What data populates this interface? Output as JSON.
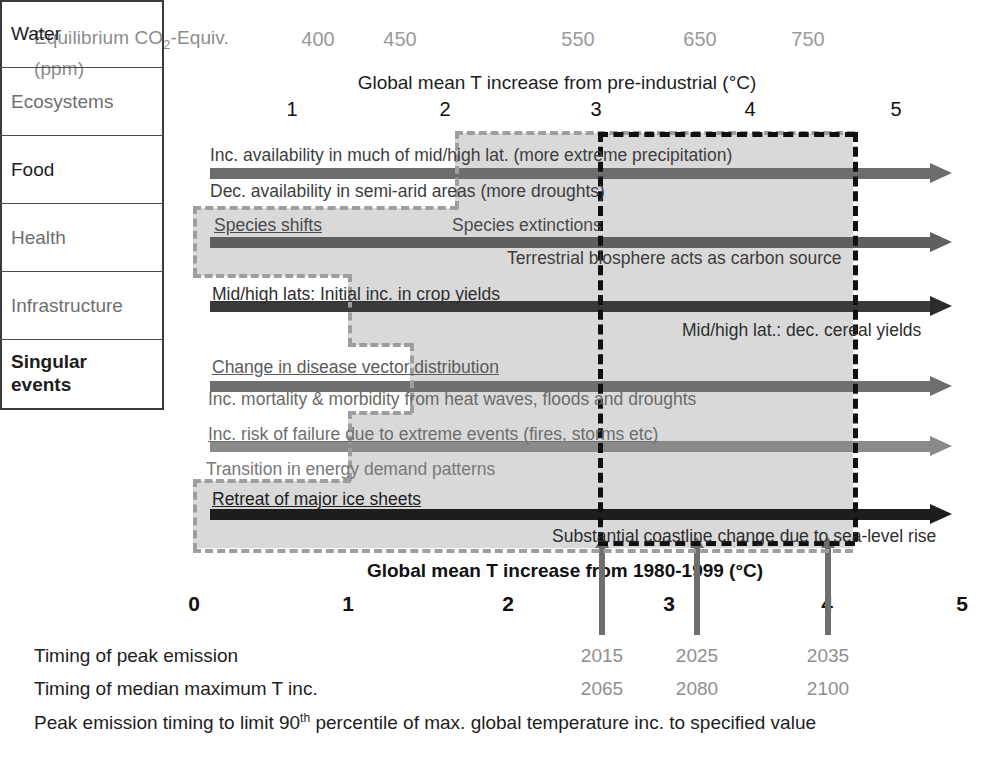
{
  "header": {
    "co2_label_line1": "Equilibrium CO",
    "co2_label_sub": "2",
    "co2_label_line1b": "-Equiv.",
    "co2_label_line2": "(ppm)",
    "co2_ticks": [
      {
        "label": "400",
        "x": 318
      },
      {
        "label": "450",
        "x": 400
      },
      {
        "label": "550",
        "x": 578
      },
      {
        "label": "650",
        "x": 700
      },
      {
        "label": "750",
        "x": 808
      }
    ],
    "top_axis_title": "Global mean T increase from pre-industrial (°C)",
    "top_ticks": [
      {
        "label": "1",
        "x": 292
      },
      {
        "label": "2",
        "x": 445
      },
      {
        "label": "3",
        "x": 596
      },
      {
        "label": "4",
        "x": 750
      },
      {
        "label": "5",
        "x": 896
      }
    ]
  },
  "categories": [
    {
      "name": "Water",
      "y": 140,
      "h": 68
    },
    {
      "name": "Ecosystems",
      "y": 208,
      "h": 68
    },
    {
      "name": "Food",
      "y": 276,
      "h": 68
    },
    {
      "name": "Health",
      "y": 344,
      "h": 68
    },
    {
      "name": "Infrastructure",
      "y": 412,
      "h": 68
    },
    {
      "name": "Singular\nevents",
      "y": 480,
      "h": 66
    }
  ],
  "impact_arrows": [
    {
      "name": "water-arrow",
      "x": 210,
      "y": 168,
      "tip": 952,
      "color": "#6d6d6d",
      "head_color": "#6d6d6d"
    },
    {
      "name": "ecosystems-arrow",
      "x": 210,
      "y": 237,
      "tip": 952,
      "color": "#5f5f5f",
      "head_color": "#5f5f5f"
    },
    {
      "name": "food-arrow",
      "x": 210,
      "y": 301,
      "tip": 952,
      "color": "#3a3a3a",
      "head_color": "#2b2b2b"
    },
    {
      "name": "health-arrow",
      "x": 210,
      "y": 381,
      "tip": 952,
      "color": "#6f6f6f",
      "head_color": "#6f6f6f"
    },
    {
      "name": "infrastructure-arrow",
      "x": 210,
      "y": 441,
      "tip": 952,
      "color": "#8a8a8a",
      "head_color": "#8a8a8a"
    },
    {
      "name": "singular-events-arrow",
      "x": 210,
      "y": 509,
      "tip": 952,
      "color": "#1d1d1d",
      "head_color": "#1d1d1d"
    }
  ],
  "impacts": [
    {
      "text": "Inc.  availability in much of mid/high lat. (more extreme precipitation)",
      "x": 210,
      "y": 145,
      "color": "#3d3d3d",
      "underline": false
    },
    {
      "text": "Dec. availability in semi-arid areas (more droughts)",
      "x": 210,
      "y": 181,
      "color": "#3d3d3d",
      "underline": false
    },
    {
      "text": "Species shifts",
      "x": 214,
      "y": 215,
      "color": "#4a4a4a",
      "underline": true
    },
    {
      "text": "Species extinctions",
      "x": 452,
      "y": 215,
      "color": "#4a4a4a",
      "underline": false
    },
    {
      "text": "Terrestrial biosphere acts as carbon source",
      "x": 507,
      "y": 248,
      "color": "#3d3d3d",
      "underline": false
    },
    {
      "text": "Mid/high lats: Initial inc. in crop yields",
      "x": 212,
      "y": 284,
      "color": "#2e2e2e",
      "underline": true
    },
    {
      "text": "Mid/high lat.: dec. cereal yields",
      "x": 682,
      "y": 320,
      "color": "#2e2e2e",
      "underline": false
    },
    {
      "text": "Change in disease vector distribution",
      "x": 212,
      "y": 357,
      "color": "#5a5a5a",
      "underline": true
    },
    {
      "text": "Inc. mortality & morbidity from heat waves, floods and droughts",
      "x": 208,
      "y": 389,
      "color": "#6a6a6a",
      "underline": false
    },
    {
      "text": "Inc. risk of failure due to extreme events (fires, storms etc)",
      "x": 208,
      "y": 424,
      "color": "#6d6d6d",
      "underline": true
    },
    {
      "text": "Transition in energy demand patterns",
      "x": 206,
      "y": 459,
      "color": "#787878",
      "underline": false
    },
    {
      "text": "Retreat of major ice sheets",
      "x": 212,
      "y": 489,
      "color": "#1d1d1d",
      "underline": true
    },
    {
      "text": "Substantial coastline change due to sea-level rise",
      "x": 552,
      "y": 526,
      "color": "#2e2e2e",
      "underline": false
    }
  ],
  "bottom_axis": {
    "title": "Global mean T increase from 1980-1999 (°C)",
    "ticks": [
      {
        "label": "0",
        "x": 194
      },
      {
        "label": "1",
        "x": 348
      },
      {
        "label": "2",
        "x": 508
      },
      {
        "label": "3",
        "x": 669
      },
      {
        "label": "4",
        "x": 827
      },
      {
        "label": "5",
        "x": 962
      }
    ]
  },
  "year_arrows": [
    {
      "x": 602,
      "peak": "2015",
      "median": "2065"
    },
    {
      "x": 697,
      "peak": "2025",
      "median": "2080"
    },
    {
      "x": 828,
      "peak": "2035",
      "median": "2100"
    }
  ],
  "footnotes": {
    "row1_label": "Timing of peak emission",
    "row2_label": "Timing of median maximum T inc.",
    "row3_a": "Peak emission timing to limit 90",
    "row3_sup": "th",
    "row3_b": " percentile of max. global temperature inc. to specified value"
  },
  "colors": {
    "shade": "#d9d9d9",
    "grey_dash": "#9e9e9e",
    "black_dash": "#101010",
    "table_border": "#3a3a3a",
    "year_arrow": "#6e6e6e"
  }
}
